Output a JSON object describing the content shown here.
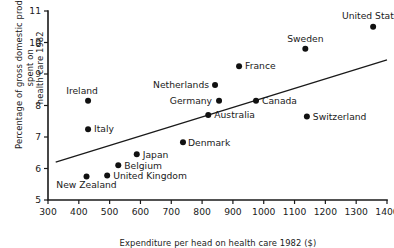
{
  "chart_data": {
    "type": "scatter",
    "title": "",
    "xlabel": "Expenditure per head on health care 1982 ($)",
    "ylabel_line1": "Percentage of gross domestic product spent on",
    "ylabel_line2": "health care 1982",
    "xlim": [
      300,
      1400
    ],
    "ylim": [
      5,
      11
    ],
    "xticks": [
      300,
      400,
      500,
      600,
      700,
      800,
      900,
      1000,
      1100,
      1200,
      1300,
      1400
    ],
    "yticks": [
      5,
      6,
      7,
      8,
      9,
      10,
      11
    ],
    "grid": false,
    "legend": "none",
    "points": [
      {
        "label": "Ireland",
        "x": 430,
        "y": 8.15,
        "label_dx": -6,
        "label_dy": -7,
        "anchor": "middle"
      },
      {
        "label": "Italy",
        "x": 430,
        "y": 7.25,
        "label_dx": 6,
        "label_dy": 3.2,
        "anchor": "start"
      },
      {
        "label": "New Zealand",
        "x": 425,
        "y": 5.75,
        "label_dx": 0,
        "label_dy": 12,
        "anchor": "middle"
      },
      {
        "label": "United Kingdom",
        "x": 492,
        "y": 5.78,
        "label_dx": 6,
        "label_dy": 3.2,
        "anchor": "start"
      },
      {
        "label": "Belgium",
        "x": 528,
        "y": 6.1,
        "label_dx": 6,
        "label_dy": 3.2,
        "anchor": "start"
      },
      {
        "label": "Japan",
        "x": 588,
        "y": 6.45,
        "label_dx": 6,
        "label_dy": 3.2,
        "anchor": "start"
      },
      {
        "label": "Denmark",
        "x": 738,
        "y": 6.83,
        "label_dx": 5,
        "label_dy": 3.2,
        "anchor": "start"
      },
      {
        "label": "Netherlands",
        "x": 842,
        "y": 8.65,
        "label_dx": -6,
        "label_dy": 3.2,
        "anchor": "end"
      },
      {
        "label": "Germany",
        "x": 855,
        "y": 8.15,
        "label_dx": -7,
        "label_dy": 3.2,
        "anchor": "end"
      },
      {
        "label": "Australia",
        "x": 820,
        "y": 7.7,
        "label_dx": 6,
        "label_dy": 3.2,
        "anchor": "start"
      },
      {
        "label": "France",
        "x": 920,
        "y": 9.25,
        "label_dx": 6,
        "label_dy": 3.2,
        "anchor": "start"
      },
      {
        "label": "Canada",
        "x": 975,
        "y": 8.15,
        "label_dx": 6,
        "label_dy": 3.2,
        "anchor": "start"
      },
      {
        "label": "Sweden",
        "x": 1135,
        "y": 9.8,
        "label_dx": 0,
        "label_dy": -7,
        "anchor": "middle"
      },
      {
        "label": "Switzerland",
        "x": 1140,
        "y": 7.65,
        "label_dx": 6,
        "label_dy": 3.2,
        "anchor": "start"
      },
      {
        "label": "United States",
        "x": 1355,
        "y": 10.5,
        "label_dx": 0,
        "label_dy": -8,
        "anchor": "middle"
      }
    ],
    "fit_line": {
      "x1": 325,
      "y1": 6.2,
      "x2": 1400,
      "y2": 9.45
    }
  }
}
